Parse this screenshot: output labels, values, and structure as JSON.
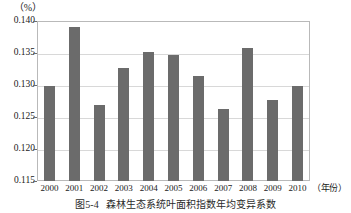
{
  "chart_data": {
    "type": "bar",
    "title": "",
    "unit_label": "（%）",
    "xlabel": "（年份）",
    "ylabel": "",
    "ylim": [
      0.115,
      0.14
    ],
    "yticks": [
      "0.115",
      "0.120",
      "0.125",
      "0.130",
      "0.135",
      "0.140"
    ],
    "ytick_values": [
      0.115,
      0.12,
      0.125,
      0.13,
      0.135,
      0.14
    ],
    "grid": true,
    "legend": "none",
    "bar_color": "#6b6b6b",
    "categories": [
      "2000",
      "2001",
      "2002",
      "2003",
      "2004",
      "2005",
      "2006",
      "2007",
      "2008",
      "2009",
      "2010"
    ],
    "values": [
      0.1298,
      0.139,
      0.1269,
      0.1327,
      0.1352,
      0.1347,
      0.1314,
      0.1262,
      0.1358,
      0.1276,
      0.1298
    ]
  },
  "caption": {
    "number": "图5-4",
    "text": "森林生态系统叶面积指数年均变异系数"
  }
}
